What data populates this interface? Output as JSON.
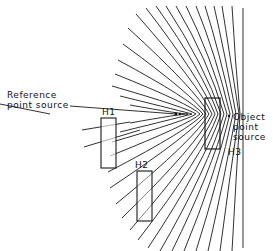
{
  "diagram": {
    "labels": {
      "reference_line1": "Reference",
      "reference_line2": "point source",
      "object_line1": "Object",
      "object_line2": "point",
      "object_line3": "source",
      "h1": "H1",
      "h2": "H2",
      "h3": "H3"
    },
    "colors": {
      "line": "#1a1a1a",
      "background": "#ffffff"
    },
    "elements": [
      "reference-point-source",
      "object-point-source",
      "interference-fringes",
      "hologram-H1",
      "hologram-H2",
      "hologram-H3",
      "reference-plane"
    ]
  }
}
